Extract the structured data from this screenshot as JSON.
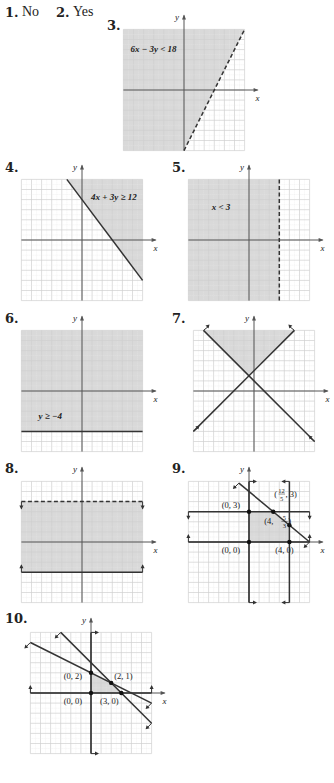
{
  "answers": [
    {
      "number": "1.",
      "text": "No"
    },
    {
      "number": "2.",
      "text": "Yes"
    }
  ],
  "colors": {
    "shade": "#d9d9d9",
    "grid_major": "#d0d0d0",
    "grid_minor": "#e6e6e6",
    "axis": "#555555",
    "line": "#333333",
    "text": "#222222"
  },
  "graphs": [
    {
      "number": "3.",
      "num_pos": [
        107,
        18
      ],
      "origin": [
        184,
        90
      ],
      "unit": 10.1,
      "range": [
        -6,
        6,
        -6,
        6
      ],
      "axis_labels": {
        "x": "x",
        "y": "y"
      },
      "shade": [
        [
          -6,
          6
        ],
        [
          6,
          6
        ],
        [
          0,
          -6
        ],
        [
          -6,
          -6
        ]
      ],
      "lines": [
        {
          "from": [
            0,
            -6
          ],
          "to": [
            6,
            6
          ],
          "style": "dashed",
          "arrows": false
        }
      ],
      "labels": [
        {
          "text": "6x − 3y < 18",
          "at": [
            -5.3,
            3.8
          ],
          "bold": true
        }
      ],
      "points": []
    },
    {
      "number": "4.",
      "num_pos": [
        5,
        160
      ],
      "origin": [
        82,
        240
      ],
      "unit": 10.1,
      "range": [
        -6,
        6,
        -6,
        6
      ],
      "axis_labels": {
        "x": "x",
        "y": "y"
      },
      "shade": [
        [
          -1.5,
          6
        ],
        [
          6,
          6
        ],
        [
          6,
          -4
        ]
      ],
      "lines": [
        {
          "from": [
            -1.5,
            6
          ],
          "to": [
            6,
            -4
          ],
          "style": "solid",
          "arrows": false
        }
      ],
      "labels": [
        {
          "text": "4x + 3y ≥ 12",
          "at": [
            0.9,
            4.0
          ],
          "bold": true
        }
      ],
      "points": []
    },
    {
      "number": "5.",
      "num_pos": [
        172,
        160
      ],
      "origin": [
        249,
        240
      ],
      "unit": 10.1,
      "range": [
        -6,
        6,
        -6,
        6
      ],
      "axis_labels": {
        "x": "x",
        "y": "y"
      },
      "shade": [
        [
          -6,
          6
        ],
        [
          3,
          6
        ],
        [
          3,
          -6
        ],
        [
          -6,
          -6
        ]
      ],
      "lines": [
        {
          "from": [
            3,
            6
          ],
          "to": [
            3,
            -6
          ],
          "style": "dashed",
          "arrows": false
        }
      ],
      "labels": [
        {
          "text": "x < 3",
          "at": [
            -3.7,
            3.0
          ],
          "bold": true
        }
      ],
      "points": []
    },
    {
      "number": "6.",
      "num_pos": [
        5,
        311
      ],
      "origin": [
        82,
        391
      ],
      "unit": 10.1,
      "range": [
        -6,
        6,
        -6,
        6
      ],
      "axis_labels": {
        "x": "x",
        "y": "y"
      },
      "shade": [
        [
          -6,
          6
        ],
        [
          6,
          6
        ],
        [
          6,
          -4
        ],
        [
          -6,
          -4
        ]
      ],
      "lines": [
        {
          "from": [
            -6,
            -4
          ],
          "to": [
            6,
            -4
          ],
          "style": "solid",
          "arrows": false
        }
      ],
      "labels": [
        {
          "text": "y ≥ −4",
          "at": [
            -4.3,
            -2.8
          ],
          "bold": true
        }
      ],
      "points": []
    },
    {
      "number": "7.",
      "num_pos": [
        172,
        311
      ],
      "origin": [
        254,
        391
      ],
      "unit": 10.1,
      "range": [
        -6,
        6,
        -6,
        6
      ],
      "axis_labels": {
        "x": "x",
        "y": "y"
      },
      "shade": [
        [
          -5,
          6
        ],
        [
          4,
          6
        ],
        [
          -0.5,
          1.5
        ]
      ],
      "lines": [
        {
          "from": [
            -5,
            6
          ],
          "to": [
            6,
            -5
          ],
          "style": "solid",
          "arrows": "both",
          "arrow_dir": "up"
        },
        {
          "from": [
            -6,
            -4
          ],
          "to": [
            4,
            6
          ],
          "style": "solid",
          "arrows": "both",
          "arrow_dir": "up"
        }
      ],
      "labels": [],
      "points": []
    },
    {
      "number": "8.",
      "num_pos": [
        5,
        461
      ],
      "origin": [
        82,
        542
      ],
      "unit": 10.1,
      "range": [
        -6,
        6,
        -6,
        6
      ],
      "axis_labels": {
        "x": "x",
        "y": "y"
      },
      "shade": [
        [
          -6,
          4
        ],
        [
          6,
          4
        ],
        [
          6,
          -3
        ],
        [
          -6,
          -3
        ]
      ],
      "lines": [
        {
          "from": [
            -6,
            4
          ],
          "to": [
            6,
            4
          ],
          "style": "dashed",
          "arrows": false
        },
        {
          "from": [
            -6,
            -3
          ],
          "to": [
            6,
            -3
          ],
          "style": "solid",
          "arrows": false
        }
      ],
      "ticks": [
        {
          "at": [
            -6,
            4
          ],
          "dir": "down"
        },
        {
          "at": [
            6,
            4
          ],
          "dir": "down"
        },
        {
          "at": [
            -6,
            -3
          ],
          "dir": "up"
        },
        {
          "at": [
            6,
            -3
          ],
          "dir": "up"
        }
      ],
      "labels": [],
      "points": []
    },
    {
      "number": "9.",
      "num_pos": [
        172,
        461
      ],
      "origin": [
        249,
        542
      ],
      "unit": 10.1,
      "range": [
        -6,
        6,
        -6,
        6
      ],
      "axis_labels": {
        "x": "x",
        "y": "y"
      },
      "shade": [
        [
          0,
          0
        ],
        [
          0,
          3
        ],
        [
          2.4,
          3
        ],
        [
          4,
          1.667
        ],
        [
          4,
          0
        ]
      ],
      "lines": [
        {
          "from": [
            -6,
            3
          ],
          "to": [
            6,
            3
          ],
          "style": "solid",
          "arrows": false
        },
        {
          "from": [
            -6,
            0
          ],
          "to": [
            6,
            0
          ],
          "style": "solid",
          "arrows": false
        },
        {
          "from": [
            0,
            6
          ],
          "to": [
            0,
            -6
          ],
          "style": "solid",
          "arrows": false
        },
        {
          "from": [
            4,
            6
          ],
          "to": [
            4,
            -6
          ],
          "style": "solid",
          "arrows": false
        },
        {
          "from": [
            -1,
            5.833
          ],
          "to": [
            6,
            0
          ],
          "style": "solid",
          "arrows": false
        }
      ],
      "ticks": [
        {
          "at": [
            -6,
            3
          ],
          "dir": "down"
        },
        {
          "at": [
            6,
            3
          ],
          "dir": "down"
        },
        {
          "at": [
            -6,
            0
          ],
          "dir": "up"
        },
        {
          "at": [
            6,
            0
          ],
          "dir": "up"
        },
        {
          "at": [
            0,
            6
          ],
          "dir": "right"
        },
        {
          "at": [
            0,
            -6
          ],
          "dir": "right"
        },
        {
          "at": [
            4,
            6
          ],
          "dir": "left"
        },
        {
          "at": [
            4,
            -6
          ],
          "dir": "left"
        },
        {
          "at": [
            -1,
            5.833
          ],
          "dir": "downleft"
        },
        {
          "at": [
            6,
            0
          ],
          "dir": "downleft"
        }
      ],
      "labels": [
        {
          "text": "(0, 3)",
          "at": [
            -2.7,
            3.35
          ],
          "bold": false
        },
        {
          "text": "(0, 0)",
          "at": [
            -2.7,
            -1.05
          ],
          "bold": false
        },
        {
          "text": "(4, 0)",
          "at": [
            2.6,
            -1.05
          ],
          "bold": false
        },
        {
          "text": "(12/5, 3)",
          "at": [
            2.5,
            4.5
          ],
          "bold": false,
          "frac": {
            "num": "12",
            "den": "5",
            "pre": "(",
            "post": ", 3)"
          }
        },
        {
          "text": "(4, 5/3)",
          "at": [
            1.5,
            1.8
          ],
          "bold": false,
          "frac": {
            "num": "5",
            "den": "3",
            "pre": "(4, ",
            "post": ")"
          }
        }
      ],
      "points": [
        [
          0,
          3
        ],
        [
          0,
          0
        ],
        [
          4,
          0
        ],
        [
          2.4,
          3
        ],
        [
          4,
          1.667
        ]
      ]
    },
    {
      "number": "10.",
      "num_pos": [
        5,
        611
      ],
      "origin": [
        91,
        693
      ],
      "unit": 10.1,
      "range": [
        -6,
        6,
        -6,
        6
      ],
      "axis_labels": {
        "x": "x",
        "y": "y"
      },
      "shade": [
        [
          0,
          0
        ],
        [
          0,
          2
        ],
        [
          2,
          1
        ],
        [
          3,
          0
        ]
      ],
      "lines": [
        {
          "from": [
            -6,
            0
          ],
          "to": [
            6,
            0
          ],
          "style": "solid",
          "arrows": false
        },
        {
          "from": [
            0,
            6
          ],
          "to": [
            0,
            -6
          ],
          "style": "solid",
          "arrows": false
        },
        {
          "from": [
            -6,
            5
          ],
          "to": [
            6,
            -1
          ],
          "style": "solid",
          "arrows": false
        },
        {
          "from": [
            -3,
            6
          ],
          "to": [
            6,
            -3
          ],
          "style": "solid",
          "arrows": false
        }
      ],
      "ticks": [
        {
          "at": [
            -6,
            0
          ],
          "dir": "up"
        },
        {
          "at": [
            6,
            0
          ],
          "dir": "up"
        },
        {
          "at": [
            0,
            6
          ],
          "dir": "right"
        },
        {
          "at": [
            0,
            -6
          ],
          "dir": "right"
        },
        {
          "at": [
            -6,
            5
          ],
          "dir": "downleft"
        },
        {
          "at": [
            6,
            -1
          ],
          "dir": "downleft"
        },
        {
          "at": [
            -3,
            6
          ],
          "dir": "downleft"
        },
        {
          "at": [
            6,
            -3
          ],
          "dir": "downleft"
        }
      ],
      "labels": [
        {
          "text": "(0, 2)",
          "at": [
            -2.7,
            1.35
          ],
          "bold": false
        },
        {
          "text": "(2, 1)",
          "at": [
            2.3,
            1.35
          ],
          "bold": false
        },
        {
          "text": "(0, 0)",
          "at": [
            -2.7,
            -1.05
          ],
          "bold": false
        },
        {
          "text": "(3, 0)",
          "at": [
            0.9,
            -1.05
          ],
          "bold": false
        }
      ],
      "points": [
        [
          0,
          2
        ],
        [
          2,
          1
        ],
        [
          0,
          0
        ],
        [
          3,
          0
        ]
      ]
    }
  ]
}
